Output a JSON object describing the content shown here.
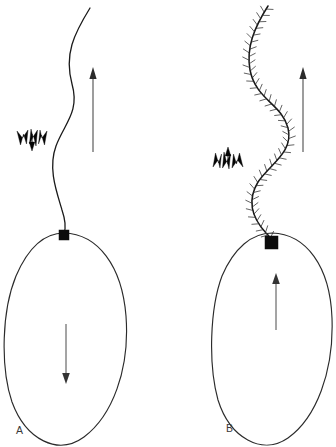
{
  "figure": {
    "caption_visible": false,
    "background_color": "#ffffff",
    "ink_color": "#1a1a1a",
    "width": 336,
    "height": 447
  },
  "panels": [
    {
      "id": "A",
      "label": "A",
      "label_x": 16,
      "label_y": 434,
      "flagellum_type": "smooth",
      "flagellum_path": "M 90 8 C 74 34, 64 54, 72 84 C 80 112, 64 124, 56 146 C 48 168, 56 190, 62 210 C 66 222, 66 228, 64 233",
      "cell_outline_path": "M 64 233 C 98 234, 122 266, 126 316 C 130 370, 112 416, 84 437 C 58 456, 26 440, 12 402 C 0 366, 2 310, 16 276 C 28 248, 44 233, 64 233 Z",
      "basal_body": {
        "x": 59,
        "y": 230,
        "width": 10,
        "height": 10,
        "shape": "square"
      },
      "body_arrow": {
        "x": 66,
        "y1": 324,
        "y2": 382,
        "direction": "down"
      },
      "motion_arrow": {
        "x": 93,
        "y1": 152,
        "y2": 68,
        "direction": "up"
      },
      "water_flow_marker": {
        "x": 32,
        "y": 140,
        "direction": "down",
        "shape": "trident",
        "prong_count": 3
      }
    },
    {
      "id": "B",
      "label": "B",
      "label_x": 226,
      "label_y": 432,
      "flagellum_type": "hairy-mastigonemes",
      "flagellum_path": "M 268 6 C 254 28, 246 48, 250 70 C 256 100, 282 104, 288 128 C 294 152, 270 164, 258 182 C 246 202, 254 220, 266 233 C 270 237, 272 239, 272 241",
      "cell_outline_path": "M 272 233 C 306 234, 330 266, 332 318 C 334 372, 316 418, 288 438 C 262 456, 230 438, 218 400 C 208 364, 210 308, 222 276 C 234 248, 252 233, 272 233 Z",
      "basal_body": {
        "x": 265,
        "y": 236,
        "width": 13,
        "height": 13,
        "shape": "square"
      },
      "body_arrow": {
        "x": 276,
        "y1": 330,
        "y2": 274,
        "direction": "up"
      },
      "motion_arrow": {
        "x": 303,
        "y1": 152,
        "y2": 68,
        "direction": "up"
      },
      "water_flow_marker": {
        "x": 228,
        "y": 158,
        "direction": "up",
        "shape": "trident-inverted",
        "prong_count": 3
      },
      "mastigoneme_count": 74,
      "mastigoneme_length": 7
    }
  ],
  "legend": {
    "basal_body_name": "basal body",
    "motion_arrow_name": "direction of cell movement",
    "water_marker_name": "direction of water flow",
    "body_arrow_name": "net thrust direction"
  }
}
